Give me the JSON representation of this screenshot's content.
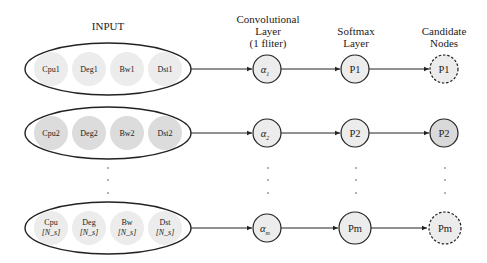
{
  "headers": {
    "input": "INPUT",
    "conv": [
      "Convolutional",
      "Layer",
      "(1 fliter)"
    ],
    "softmax": [
      "Softmax",
      "Layer"
    ],
    "candidate": [
      "Candidate",
      "Nodes"
    ]
  },
  "rows": [
    {
      "inputs": [
        [
          "Cpu1"
        ],
        [
          "Deg1"
        ],
        [
          "Bw1"
        ],
        [
          "Dst1"
        ]
      ],
      "alpha_sub": "1",
      "softmax": "P1",
      "candidate": "P1",
      "candidate_style": "dashed"
    },
    {
      "inputs": [
        [
          "Cpu2"
        ],
        [
          "Deg2"
        ],
        [
          "Bw2"
        ],
        [
          "Dst2"
        ]
      ],
      "alpha_sub": "2",
      "softmax": "P2",
      "candidate": "P2",
      "candidate_style": "solid"
    },
    {
      "inputs": [
        [
          "Cpu",
          "[N_s]"
        ],
        [
          "Deg",
          "[N_s]"
        ],
        [
          "Bw",
          "[N_s]"
        ],
        [
          "Dst",
          "[N_s]"
        ]
      ],
      "alpha_sub": "m",
      "softmax": "Pm",
      "candidate": "Pm",
      "candidate_style": "dashed"
    }
  ],
  "alpha_symbol": "α",
  "ellipsis": "·",
  "colors": {
    "stroke": "#222222",
    "input_fill_row1": "#ececec",
    "input_fill_row2": "#dcdcdc",
    "input_fill_row3": "#ececec",
    "node_fill": "#ececec",
    "candidate_fill_row2": "#d9d9d9"
  }
}
